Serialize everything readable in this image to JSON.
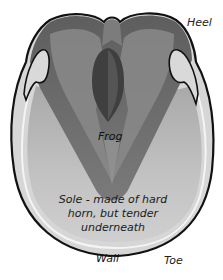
{
  "diagram": {
    "labels": {
      "heel": "Heel",
      "frog": "Frog",
      "sole": "Sole - made of hard horn, but tender underneath",
      "wall": "Wall",
      "toe": "Toe"
    },
    "colors": {
      "outline": "#111111",
      "wall": "#d4d4d4",
      "sole": "#bdbdbd",
      "frog_dark": "#474747",
      "frog_mid": "#6e6e6e",
      "bars_light": "#c8c8c8",
      "background": "#ffffff"
    }
  }
}
